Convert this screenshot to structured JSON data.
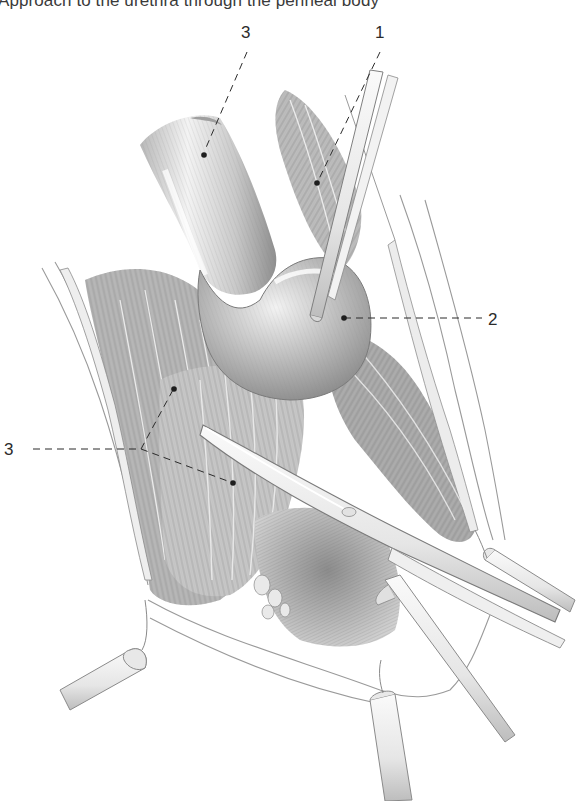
{
  "figure": {
    "caption": "Approach to the urethra through the perineal body",
    "style": "pencil anatomical illustration",
    "colors": {
      "background": "#ffffff",
      "ink": "#2b2b2b",
      "tissue_dark": "#6e6e6e",
      "tissue_mid": "#a8a8a8",
      "tissue_light": "#dcdcdc"
    }
  },
  "labels": [
    {
      "id": "label-3-top",
      "text": "3",
      "x": 241,
      "y": 24,
      "leader": "dashed",
      "target": "urethral bulb / bulbospongiosus"
    },
    {
      "id": "label-1",
      "text": "1",
      "x": 375,
      "y": 24,
      "leader": "dashed",
      "target": "muscle fibers near retractor"
    },
    {
      "id": "label-2",
      "text": "2",
      "x": 488,
      "y": 311,
      "leader": "dashed",
      "target": "mobilized urethra (rounded bulge)"
    },
    {
      "id": "label-3-left",
      "text": "3",
      "x": 4,
      "y": 441,
      "leader": "dashed-branching",
      "target": "muscle bundles (two points)"
    }
  ],
  "instruments": [
    {
      "name": "retractor-upper",
      "description": "narrow blade retracting tissue upward-right"
    },
    {
      "name": "scissors",
      "description": "long curved scissors crossing diagonally"
    },
    {
      "name": "retractor-left",
      "description": "blunt retractor at lower left"
    },
    {
      "name": "retractor-right",
      "description": "blunt retractor at lower right"
    },
    {
      "name": "retractor-bottom",
      "description": "blunt retractor at bottom center"
    },
    {
      "name": "forceps",
      "description": "straight instrument pointing down-right"
    }
  ]
}
